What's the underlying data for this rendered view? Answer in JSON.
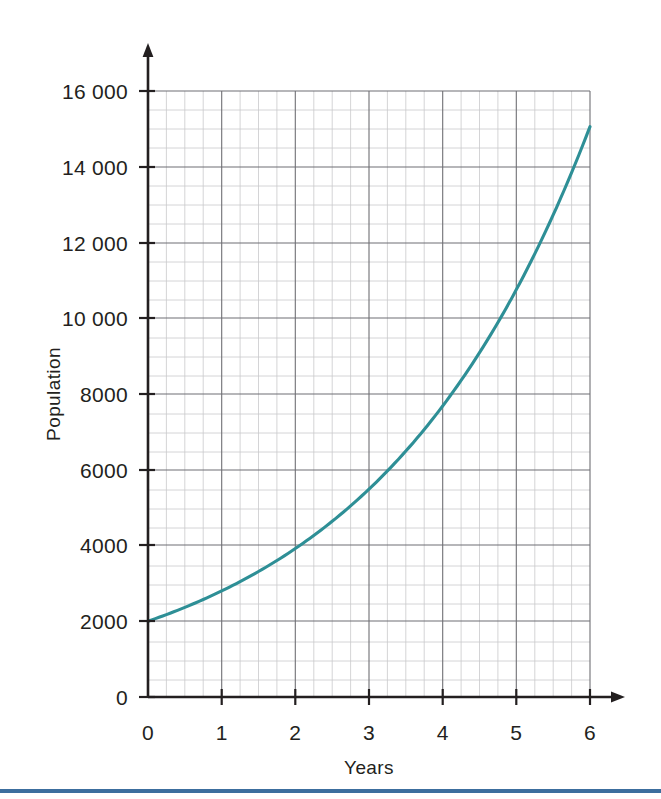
{
  "figure": {
    "background_color": "#ffffff",
    "bottom_rule_color": "#3c6e9e"
  },
  "chart_data": {
    "type": "line",
    "title": "",
    "xlabel": "Years",
    "ylabel": "Population",
    "xlim": [
      0,
      6
    ],
    "ylim": [
      0,
      16000
    ],
    "x_ticks": [
      "0",
      "1",
      "2",
      "3",
      "4",
      "5",
      "6"
    ],
    "x_tick_values": [
      0,
      1,
      2,
      3,
      4,
      5,
      6
    ],
    "y_ticks": [
      "0",
      "2000",
      "4000",
      "6000",
      "8000",
      "10 000",
      "12 000",
      "14 000",
      "16 000"
    ],
    "y_tick_values": [
      0,
      2000,
      4000,
      6000,
      8000,
      10000,
      12000,
      14000,
      16000
    ],
    "y_axis_origin_label": "0",
    "grid": true,
    "grid_major_step_x": 1,
    "grid_minor_step_x": 0.25,
    "grid_major_step_y": 2000,
    "grid_minor_step_y": 500,
    "legend": "none",
    "curve_color": "#2e8f96",
    "series": [
      {
        "name": "Population",
        "x": [
          0,
          0.25,
          0.5,
          0.75,
          1,
          1.25,
          1.5,
          1.75,
          2,
          2.25,
          2.5,
          2.75,
          3,
          3.25,
          3.5,
          3.75,
          4,
          4.25,
          4.5,
          4.75,
          5,
          5.25,
          5.5,
          5.75,
          6
        ],
        "values": [
          2000,
          2160,
          2332,
          2518,
          2800,
          2935,
          3169,
          3422,
          3920,
          3989,
          4307,
          4650,
          5488,
          5419,
          5851,
          6318,
          7683,
          7365,
          7952,
          8587,
          10756,
          10010,
          10809,
          11672,
          15059
        ]
      }
    ],
    "annotations": []
  },
  "axis": {
    "x_axis_name": "x-axis",
    "y_axis_name": "y-axis",
    "x_arrow": "arrow-right",
    "y_arrow": "arrow-up"
  }
}
